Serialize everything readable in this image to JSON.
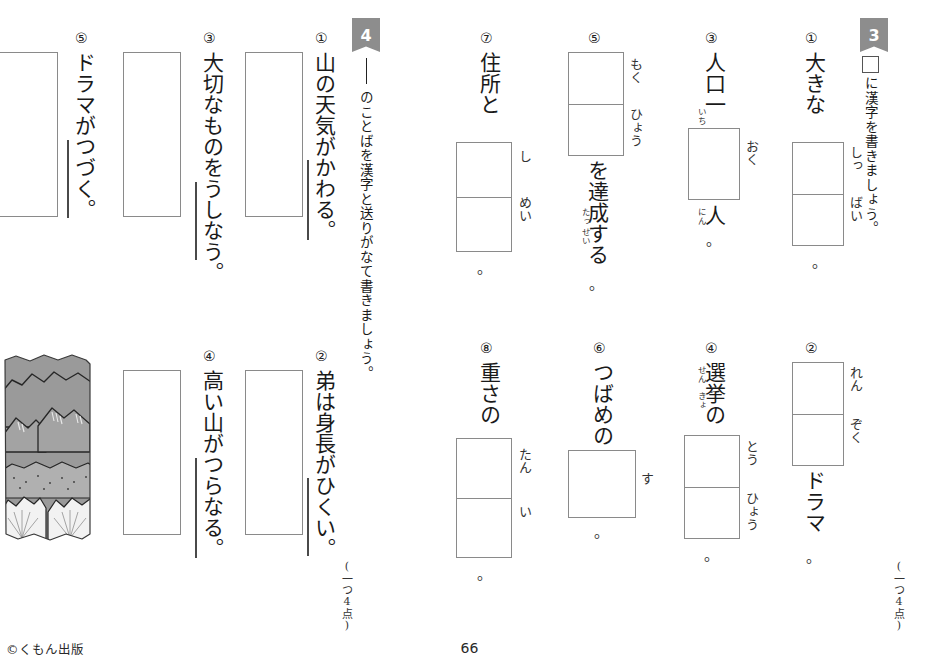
{
  "page": {
    "number": "66",
    "copyright": "©くもん出版"
  },
  "sections": [
    {
      "id": "3",
      "flag": "3",
      "instruction": "に漢字を書きましょう。",
      "points": "(一つ4点)",
      "items": [
        {
          "num": "①",
          "prefix": "大きな",
          "suffix": "",
          "end": "。",
          "boxes": 2,
          "hints": [
            "しっ",
            "ばい"
          ],
          "ruby": []
        },
        {
          "num": "②",
          "prefix": "",
          "suffix": "ドラマ",
          "end": "。",
          "boxes": 2,
          "hints": [
            "れん",
            "ぞく"
          ],
          "ruby": []
        },
        {
          "num": "③",
          "prefix": "人口一",
          "suffix": "人",
          "end": "。",
          "boxes": 1,
          "hints": [
            "おく"
          ],
          "ruby": [
            "いち",
            "にん"
          ]
        },
        {
          "num": "④",
          "prefix": "選挙の",
          "suffix": "",
          "end": "。",
          "boxes": 2,
          "hints": [
            "とう",
            "ひょう"
          ],
          "ruby": [
            "せん",
            "きょ"
          ]
        },
        {
          "num": "⑤",
          "prefix": "",
          "suffix": "を達成する",
          "end": "。",
          "boxes": 2,
          "hints": [
            "もく",
            "ひょう"
          ],
          "ruby": [
            "たっ",
            "せい"
          ]
        },
        {
          "num": "⑥",
          "prefix": "つばめの",
          "suffix": "",
          "end": "。",
          "boxes": 1,
          "hints": [
            "す"
          ],
          "ruby": []
        },
        {
          "num": "⑦",
          "prefix": "住所と",
          "suffix": "",
          "end": "。",
          "boxes": 2,
          "hints": [
            "し",
            "めい"
          ],
          "ruby": []
        },
        {
          "num": "⑧",
          "prefix": "重さの",
          "suffix": "",
          "end": "。",
          "boxes": 2,
          "hints": [
            "たん",
            "い"
          ],
          "ruby": []
        }
      ]
    },
    {
      "id": "4",
      "flag": "4",
      "instruction": "のことばを漢字と送りがなて書きましょう。",
      "points": "(一つ4点)",
      "items": [
        {
          "num": "①",
          "sentence": "山の天気がかわる。"
        },
        {
          "num": "②",
          "sentence": "弟は身長がひくい。"
        },
        {
          "num": "③",
          "sentence": "大切なものをうしなう。"
        },
        {
          "num": "④",
          "sentence": "高い山がつらなる。"
        },
        {
          "num": "⑤",
          "sentence": "ドラマがつづく。"
        }
      ]
    }
  ],
  "illustration": {
    "name": "mountain-range-illustration",
    "background": "#9a9a9a"
  }
}
